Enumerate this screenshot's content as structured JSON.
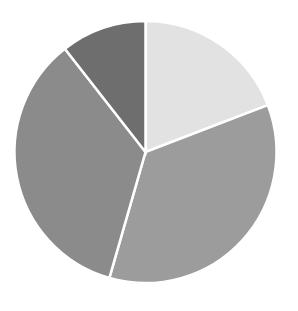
{
  "chart_data": {
    "type": "pie",
    "title": "",
    "subtitle": "",
    "xlabel": "",
    "ylabel": "",
    "legend": "none",
    "grid": false,
    "labels_visible": false,
    "start_angle_deg": 0,
    "direction": "clockwise",
    "categories": [
      "Slice 1",
      "Slice 2",
      "Slice 3",
      "Slice 4"
    ],
    "values": [
      19.2,
      35.3,
      35.0,
      10.5
    ],
    "percentages": [
      "19.2%",
      "35.3%",
      "35.0%",
      "10.5%"
    ],
    "angles_deg": [
      69,
      127,
      126,
      38
    ],
    "slices": [
      {
        "name": "Slice 1",
        "value": 19.2,
        "percent": "19.2%",
        "angle_deg": 69,
        "start_deg": 0,
        "end_deg": 69,
        "color": "#e2e2e2"
      },
      {
        "name": "Slice 2",
        "value": 35.3,
        "percent": "35.3%",
        "angle_deg": 127,
        "start_deg": 69,
        "end_deg": 196,
        "color": "#9c9c9c"
      },
      {
        "name": "Slice 3",
        "value": 35.0,
        "percent": "35.0%",
        "angle_deg": 126,
        "start_deg": 196,
        "end_deg": 322,
        "color": "#8b8b8b"
      },
      {
        "name": "Slice 4",
        "value": 10.5,
        "percent": "10.5%",
        "angle_deg": 38,
        "start_deg": 322,
        "end_deg": 360,
        "color": "#6e6e6e"
      }
    ],
    "geometry": {
      "center_x": 145.5,
      "center_y": 152,
      "radius": 131
    },
    "style": {
      "background": "#ffffff",
      "slice_border_color": "#ffffff",
      "slice_border_width": 2.5
    }
  }
}
